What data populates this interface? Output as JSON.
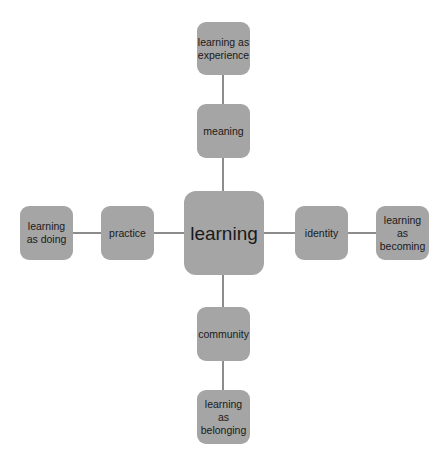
{
  "diagram": {
    "center": {
      "label": "learning"
    },
    "nodes": {
      "top_inner": {
        "label": "meaning"
      },
      "top_outer": {
        "label": "learning as experience"
      },
      "left_inner": {
        "label": "practice"
      },
      "left_outer": {
        "label": "learning as doing"
      },
      "right_inner": {
        "label": "identity"
      },
      "right_outer": {
        "label": "learning as becoming"
      },
      "bottom_inner": {
        "label": "community"
      },
      "bottom_outer": {
        "label": "learning as belonging"
      }
    },
    "colors": {
      "node_fill": "#a5a5a5",
      "connector": "#8c8c8c",
      "text": "#1a1a1a"
    }
  }
}
